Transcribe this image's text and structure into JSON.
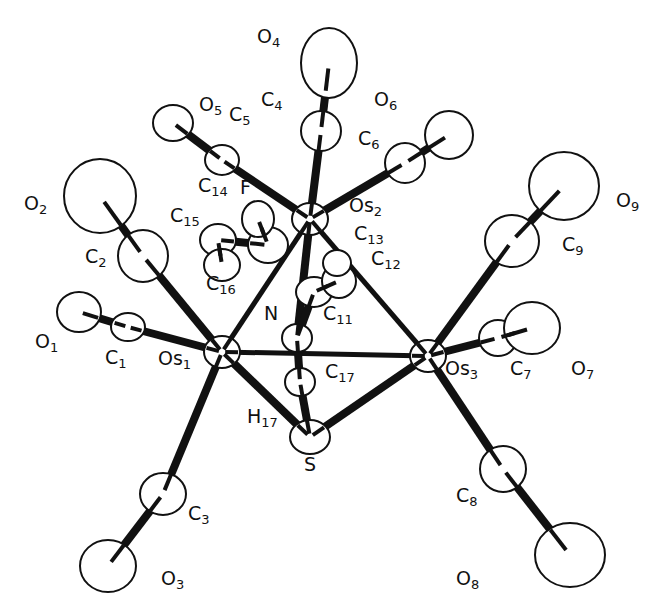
{
  "diagram": {
    "type": "ORTEP molecular structure",
    "atoms": [
      {
        "id": "Os1",
        "el": "Os",
        "sub": "1",
        "x": 222,
        "y": 352,
        "rx": 18,
        "ry": 16
      },
      {
        "id": "Os2",
        "el": "Os",
        "sub": "2",
        "x": 310,
        "y": 219,
        "rx": 18,
        "ry": 16
      },
      {
        "id": "Os3",
        "el": "Os",
        "sub": "3",
        "x": 428,
        "y": 356,
        "rx": 18,
        "ry": 16
      },
      {
        "id": "S",
        "el": "S",
        "sub": "",
        "x": 310,
        "y": 437,
        "rx": 20,
        "ry": 17
      },
      {
        "id": "N",
        "el": "N",
        "sub": "",
        "x": 297,
        "y": 338,
        "rx": 15,
        "ry": 14
      },
      {
        "id": "C1",
        "el": "C",
        "sub": "1",
        "x": 128,
        "y": 327,
        "rx": 17,
        "ry": 14
      },
      {
        "id": "O1",
        "el": "O",
        "sub": "1",
        "x": 79,
        "y": 312,
        "rx": 22,
        "ry": 20
      },
      {
        "id": "C2",
        "el": "C",
        "sub": "2",
        "x": 143,
        "y": 256,
        "rx": 25,
        "ry": 26
      },
      {
        "id": "O2",
        "el": "O",
        "sub": "2",
        "x": 100,
        "y": 196,
        "rx": 36,
        "ry": 37
      },
      {
        "id": "C3",
        "el": "C",
        "sub": "3",
        "x": 163,
        "y": 494,
        "rx": 23,
        "ry": 21
      },
      {
        "id": "O3",
        "el": "O",
        "sub": "3",
        "x": 108,
        "y": 566,
        "rx": 28,
        "ry": 26
      },
      {
        "id": "C4",
        "el": "C",
        "sub": "4",
        "x": 321,
        "y": 131,
        "rx": 20,
        "ry": 20
      },
      {
        "id": "O4",
        "el": "O",
        "sub": "4",
        "x": 329,
        "y": 63,
        "rx": 28,
        "ry": 35
      },
      {
        "id": "C5",
        "el": "C",
        "sub": "5",
        "x": 222,
        "y": 160,
        "rx": 17,
        "ry": 15
      },
      {
        "id": "O5",
        "el": "O",
        "sub": "5",
        "x": 173,
        "y": 123,
        "rx": 20,
        "ry": 18
      },
      {
        "id": "C6",
        "el": "C",
        "sub": "6",
        "x": 405,
        "y": 163,
        "rx": 20,
        "ry": 20
      },
      {
        "id": "O6",
        "el": "O",
        "sub": "6",
        "x": 449,
        "y": 135,
        "rx": 24,
        "ry": 24
      },
      {
        "id": "C7",
        "el": "C",
        "sub": "7",
        "x": 498,
        "y": 338,
        "rx": 19,
        "ry": 18
      },
      {
        "id": "O7",
        "el": "O",
        "sub": "7",
        "x": 532,
        "y": 328,
        "rx": 28,
        "ry": 26
      },
      {
        "id": "C8",
        "el": "C",
        "sub": "8",
        "x": 503,
        "y": 469,
        "rx": 23,
        "ry": 23
      },
      {
        "id": "O8",
        "el": "O",
        "sub": "8",
        "x": 570,
        "y": 555,
        "rx": 35,
        "ry": 32
      },
      {
        "id": "C9",
        "el": "C",
        "sub": "9",
        "x": 512,
        "y": 241,
        "rx": 27,
        "ry": 26
      },
      {
        "id": "O9",
        "el": "O",
        "sub": "9",
        "x": 564,
        "y": 186,
        "rx": 35,
        "ry": 34
      },
      {
        "id": "C11",
        "el": "C",
        "sub": "11",
        "x": 314,
        "y": 292,
        "rx": 18,
        "ry": 15
      },
      {
        "id": "C12",
        "el": "C",
        "sub": "12",
        "x": 339,
        "y": 281,
        "rx": 17,
        "ry": 17
      },
      {
        "id": "C13",
        "el": "C",
        "sub": "13",
        "x": 337,
        "y": 263,
        "rx": 14,
        "ry": 13
      },
      {
        "id": "C14",
        "el": "C",
        "sub": "14",
        "x": 268,
        "y": 245,
        "rx": 20,
        "ry": 18
      },
      {
        "id": "C15",
        "el": "C",
        "sub": "15",
        "x": 218,
        "y": 240,
        "rx": 18,
        "ry": 16
      },
      {
        "id": "C16",
        "el": "C",
        "sub": "16",
        "x": 222,
        "y": 265,
        "rx": 18,
        "ry": 16
      },
      {
        "id": "F",
        "el": "F",
        "sub": "",
        "x": 258,
        "y": 219,
        "rx": 16,
        "ry": 18
      },
      {
        "id": "C17",
        "el": "C",
        "sub": "17",
        "x": 300,
        "y": 382,
        "rx": 15,
        "ry": 14
      }
    ],
    "bonds": [
      [
        "Os1",
        "Os2"
      ],
      [
        "Os1",
        "Os3"
      ],
      [
        "Os2",
        "Os3"
      ],
      [
        "Os1",
        "S"
      ],
      [
        "Os3",
        "S"
      ],
      [
        "Os1",
        "C1"
      ],
      [
        "C1",
        "O1"
      ],
      [
        "Os1",
        "C2"
      ],
      [
        "C2",
        "O2"
      ],
      [
        "Os1",
        "C3"
      ],
      [
        "C3",
        "O3"
      ],
      [
        "Os2",
        "C4"
      ],
      [
        "C4",
        "O4"
      ],
      [
        "Os2",
        "C5"
      ],
      [
        "C5",
        "O5"
      ],
      [
        "Os2",
        "C6"
      ],
      [
        "C6",
        "O6"
      ],
      [
        "Os3",
        "C7"
      ],
      [
        "C7",
        "O7"
      ],
      [
        "Os3",
        "C8"
      ],
      [
        "C8",
        "O8"
      ],
      [
        "Os3",
        "C9"
      ],
      [
        "C9",
        "O9"
      ],
      [
        "Os2",
        "N"
      ],
      [
        "N",
        "C17"
      ],
      [
        "C17",
        "S"
      ],
      [
        "N",
        "C11"
      ],
      [
        "C11",
        "C12"
      ],
      [
        "C14",
        "C15"
      ],
      [
        "C16",
        "C15"
      ],
      [
        "C14",
        "F"
      ]
    ],
    "labels": [
      {
        "id": "O4",
        "text": "O",
        "sub": "4",
        "x": 257,
        "y": 41
      },
      {
        "id": "O5",
        "text": "O",
        "sub": "5",
        "x": 199,
        "y": 109
      },
      {
        "id": "C4",
        "text": "C",
        "sub": "4",
        "x": 261,
        "y": 104
      },
      {
        "id": "C5",
        "text": "C",
        "sub": "5",
        "x": 229,
        "y": 119
      },
      {
        "id": "O6",
        "text": "O",
        "sub": "6",
        "x": 374,
        "y": 104
      },
      {
        "id": "C6",
        "text": "C",
        "sub": "6",
        "x": 358,
        "y": 143
      },
      {
        "id": "O2",
        "text": "O",
        "sub": "2",
        "x": 24,
        "y": 208
      },
      {
        "id": "C2",
        "text": "C",
        "sub": "2",
        "x": 85,
        "y": 261
      },
      {
        "id": "C14",
        "text": "C",
        "sub": "14",
        "x": 198,
        "y": 190
      },
      {
        "id": "F",
        "text": "F",
        "sub": "",
        "x": 240,
        "y": 192
      },
      {
        "id": "C15",
        "text": "C",
        "sub": "15",
        "x": 170,
        "y": 220
      },
      {
        "id": "Os2",
        "text": "Os",
        "sub": "2",
        "x": 349,
        "y": 210
      },
      {
        "id": "C13",
        "text": "C",
        "sub": "13",
        "x": 354,
        "y": 238
      },
      {
        "id": "C12",
        "text": "C",
        "sub": "12",
        "x": 371,
        "y": 263
      },
      {
        "id": "C16",
        "text": "C",
        "sub": "16",
        "x": 206,
        "y": 288
      },
      {
        "id": "N",
        "text": "N",
        "sub": "",
        "x": 264,
        "y": 318
      },
      {
        "id": "C11",
        "text": "C",
        "sub": "11",
        "x": 323,
        "y": 318
      },
      {
        "id": "O9",
        "text": "O",
        "sub": "9",
        "x": 616,
        "y": 205
      },
      {
        "id": "C9",
        "text": "C",
        "sub": "9",
        "x": 562,
        "y": 249
      },
      {
        "id": "O1",
        "text": "O",
        "sub": "1",
        "x": 35,
        "y": 346
      },
      {
        "id": "C1",
        "text": "C",
        "sub": "1",
        "x": 105,
        "y": 362
      },
      {
        "id": "Os1",
        "text": "Os",
        "sub": "1",
        "x": 158,
        "y": 363
      },
      {
        "id": "Os3",
        "text": "Os",
        "sub": "3",
        "x": 445,
        "y": 373
      },
      {
        "id": "C7",
        "text": "C",
        "sub": "7",
        "x": 510,
        "y": 373
      },
      {
        "id": "O7",
        "text": "O",
        "sub": "7",
        "x": 571,
        "y": 373
      },
      {
        "id": "C17",
        "text": "C",
        "sub": "17",
        "x": 325,
        "y": 376
      },
      {
        "id": "H17",
        "text": "H",
        "sub": "17",
        "x": 247,
        "y": 421
      },
      {
        "id": "S",
        "text": "S",
        "sub": "",
        "x": 304,
        "y": 469
      },
      {
        "id": "C3",
        "text": "C",
        "sub": "3",
        "x": 188,
        "y": 518
      },
      {
        "id": "C8",
        "text": "C",
        "sub": "8",
        "x": 456,
        "y": 500
      },
      {
        "id": "O3",
        "text": "O",
        "sub": "3",
        "x": 161,
        "y": 583
      },
      {
        "id": "O8",
        "text": "O",
        "sub": "8",
        "x": 456,
        "y": 583
      }
    ]
  }
}
